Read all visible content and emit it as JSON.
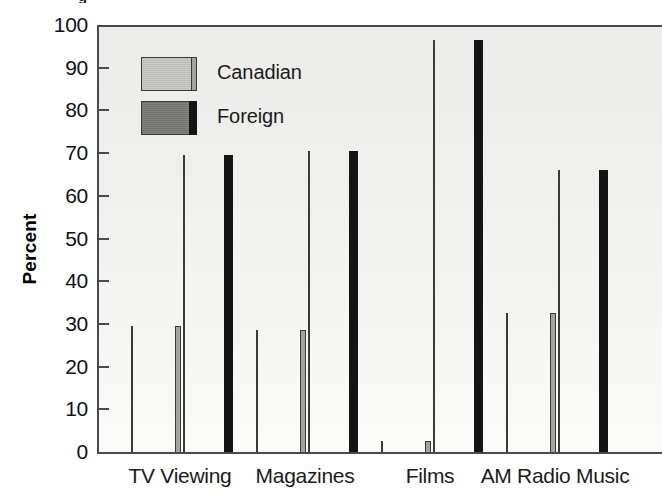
{
  "top_fragment": "g",
  "chart_data": {
    "type": "bar",
    "title": "",
    "xlabel": "",
    "ylabel": "Percent",
    "ylim": [
      0,
      100
    ],
    "ytick_step": 10,
    "grid": false,
    "legend_position": "inside-top-left",
    "categories": [
      "TV Viewing",
      "Magazines",
      "Films",
      "AM Radio Music"
    ],
    "series": [
      {
        "name": "Canadian",
        "color": "#c3c3c2",
        "values": [
          30,
          29,
          3,
          33
        ]
      },
      {
        "name": "Foreign",
        "color": "#777776",
        "values": [
          70,
          71,
          97,
          66.5
        ]
      }
    ],
    "ytick_labels": [
      "100",
      "90",
      "80",
      "70",
      "60",
      "50",
      "40",
      "30",
      "20",
      "10",
      "0"
    ],
    "ytick_values": [
      100,
      90,
      80,
      70,
      60,
      50,
      40,
      30,
      20,
      10,
      0
    ]
  },
  "axis": {
    "y_title": "Percent"
  },
  "legend": {
    "items": [
      {
        "label": "Canadian"
      },
      {
        "label": "Foreign"
      }
    ]
  },
  "colors": {
    "canadian_fill": "#c3c3c2",
    "foreign_fill": "#777776",
    "bar_outline": "#3a3a3a",
    "axis": "#4a4a4a",
    "plot_bg": "#efefee",
    "page_bg": "#ffffff",
    "text": "#1b1b1b"
  },
  "geometry": {
    "plot_left": 97,
    "plot_top": 25,
    "plot_width": 563,
    "plot_bottom": 452,
    "plot_height": 427,
    "group_centers": [
      180,
      305,
      430,
      555
    ],
    "bar_width": 50,
    "bar_gap": 2
  }
}
